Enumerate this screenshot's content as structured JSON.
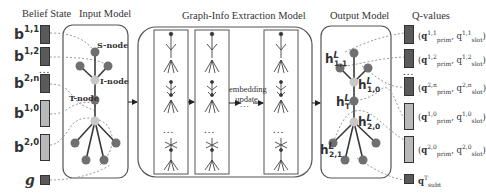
{
  "headers": {
    "belief_state": "Belief State",
    "input_model": "Input Model",
    "graph_info": "Graph-Info Extraction Model",
    "output_model": "Output Model",
    "q_values": "Q-values"
  },
  "belief_vectors": [
    {
      "base": "b",
      "sup": "1,1",
      "shade": "dark"
    },
    {
      "base": "b",
      "sup": "1,2",
      "shade": "dark"
    },
    {
      "base": "b",
      "sup": "2,n",
      "shade": "dark"
    },
    {
      "base": "b",
      "sup": "1,0",
      "shade": "light"
    },
    {
      "base": "b",
      "sup": "2,0",
      "shade": "light"
    },
    {
      "base": "g",
      "sup": "",
      "shade": "dark"
    }
  ],
  "ellipsis": "...",
  "input_nodes": {
    "s_node": "S-node",
    "i_node": "I-node",
    "t_node": "T-node"
  },
  "graph_info": {
    "middle_text_line1": "embedding",
    "middle_text_line2": "update",
    "middle_ellipsis": "..."
  },
  "output_nodes": {
    "h11": {
      "base": "h",
      "sup": "L",
      "sub": "1,1"
    },
    "h10": {
      "base": "h",
      "sup": "L",
      "sub": "1,0"
    },
    "hT": {
      "base": "h",
      "sup": "L",
      "sub": "T"
    },
    "h20": {
      "base": "h",
      "sup": "L",
      "sub": "2,0"
    },
    "h21": {
      "base": "h",
      "sup": "L",
      "sub": "2,1"
    }
  },
  "q_values": [
    {
      "text": "(q_prim^{1,1}, q_slot^{1,1})",
      "shade": "dark",
      "sup": "1,1"
    },
    {
      "text": "(q_prim^{1,2}, q_slot^{1,2})",
      "shade": "dark",
      "sup": "1,2"
    },
    {
      "text": "(q_prim^{2,n}, q_slot^{2,n})",
      "shade": "dark",
      "sup": "2,n"
    },
    {
      "text": "(q_prim^{1,0}, q_slot^{1,0})",
      "shade": "light",
      "sup": "1,0"
    },
    {
      "text": "(q_prim^{2,0}, q_slot^{2,0})",
      "shade": "light",
      "sup": "2,0"
    },
    {
      "text": "q_subt^T",
      "shade": "dark",
      "sup": "T"
    }
  ],
  "q_labels": {
    "prim": "prim",
    "slot": "slot",
    "subt": "subt",
    "q": "q"
  },
  "colors": {
    "dark_node": "#707070",
    "light_node": "#c8c8c8",
    "dark_vector": "#5a5a5a",
    "light_vector": "#b9b9b9",
    "dashed_line": "#9a9a9a",
    "border": "#444444"
  }
}
